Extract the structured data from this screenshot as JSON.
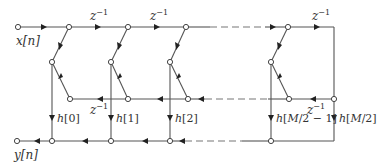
{
  "diagram": {
    "type": "signal-flow-graph",
    "input_label": "x[n]",
    "output_label": "y[n]",
    "delay_label": "z",
    "delay_exp": "−1",
    "coefficients": [
      {
        "label": "h[0]"
      },
      {
        "label": "h[1]"
      },
      {
        "label": "h[2]"
      },
      {
        "label": "h[M/2 − 1]"
      },
      {
        "label": "h[M/2]"
      }
    ],
    "colors": {
      "line": "#555555",
      "dashed": "#777777",
      "node_fill": "#ffffff",
      "text": "#333333"
    }
  }
}
